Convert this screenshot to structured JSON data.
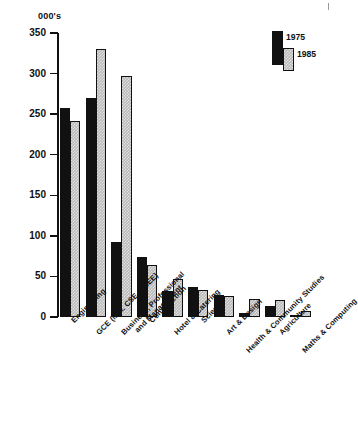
{
  "chart_data": {
    "type": "bar",
    "title": "",
    "subtitle": "",
    "unit_caption": "000's",
    "xlabel": "",
    "ylabel": "",
    "ylim": [
      0,
      350
    ],
    "ytick_step": 50,
    "yticks": [
      "0",
      "50",
      "100",
      "150",
      "200",
      "250",
      "300",
      "350"
    ],
    "grid": false,
    "legend_position": "top-right",
    "categories": [
      "Engineering",
      "GCE (incl. CSE & CEE)",
      "Business, Professional\nand Management",
      "Construction",
      "Hotel & Catering",
      "Science",
      "Art & Design",
      "Health & Community Studies",
      "Agriculture",
      "Maths & Computing"
    ],
    "series": [
      {
        "name": "1975",
        "color": "#111111",
        "values": [
          258,
          270,
          92,
          74,
          32,
          37,
          27,
          5,
          13,
          1
        ]
      },
      {
        "name": "1985",
        "color": "#b9b9b9",
        "values": [
          242,
          330,
          297,
          64,
          47,
          33,
          26,
          22,
          21,
          7
        ]
      }
    ]
  },
  "legend": {
    "entries": [
      {
        "label": "1975"
      },
      {
        "label": "1985"
      }
    ]
  }
}
